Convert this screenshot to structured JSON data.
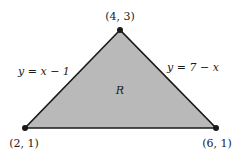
{
  "diagram": {
    "region_label": "R",
    "vertices": [
      {
        "name": "top",
        "label": "(4, 3)",
        "px": [
          120,
          30
        ]
      },
      {
        "name": "left",
        "label": "(2, 1)",
        "px": [
          25,
          128
        ]
      },
      {
        "name": "right",
        "label": "(6, 1)",
        "px": [
          216,
          128
        ]
      }
    ],
    "edges": [
      {
        "name": "left-edge",
        "label_y": "y",
        "label_eq": "=",
        "label_rhs": "x − 1"
      },
      {
        "name": "right-edge",
        "label_y": "y",
        "label_eq": "=",
        "label_rhs": "7 − x"
      }
    ],
    "colors": {
      "fill": "#b9b9b9",
      "stroke": "#1a1a1a"
    }
  }
}
